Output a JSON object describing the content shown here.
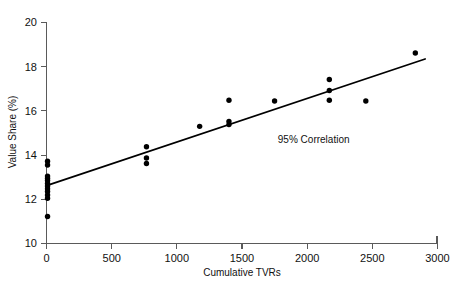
{
  "chart_data": {
    "type": "scatter",
    "title": "",
    "xlabel": "Cumulative TVRs",
    "ylabel": "Value Share (%)",
    "xlim": [
      0,
      3000
    ],
    "ylim": [
      10,
      20
    ],
    "xticks": [
      0,
      500,
      1000,
      1500,
      2000,
      2500,
      3000
    ],
    "yticks": [
      10,
      12,
      14,
      16,
      18,
      20
    ],
    "xtick_labels": [
      "0",
      "500",
      "1000",
      "1500",
      "2000",
      "2500",
      "3000"
    ],
    "ytick_labels": [
      "10",
      "12",
      "14",
      "16",
      "18",
      "20"
    ],
    "grid": false,
    "legend": null,
    "annotations": [
      {
        "text": "95% Correlation",
        "x": 2050,
        "y": 14.55
      }
    ],
    "series": [
      {
        "name": "Observations",
        "marker": "filled-circle",
        "color": "#000000",
        "points": [
          {
            "x": 8,
            "y": 13.72
          },
          {
            "x": 8,
            "y": 13.55
          },
          {
            "x": 8,
            "y": 13.05
          },
          {
            "x": 8,
            "y": 12.95
          },
          {
            "x": 8,
            "y": 12.85
          },
          {
            "x": 8,
            "y": 12.72
          },
          {
            "x": 8,
            "y": 12.6
          },
          {
            "x": 8,
            "y": 12.48
          },
          {
            "x": 8,
            "y": 12.35
          },
          {
            "x": 8,
            "y": 12.2
          },
          {
            "x": 8,
            "y": 12.05
          },
          {
            "x": 8,
            "y": 11.22
          },
          {
            "x": 767,
            "y": 14.38
          },
          {
            "x": 767,
            "y": 13.87
          },
          {
            "x": 767,
            "y": 13.62
          },
          {
            "x": 1175,
            "y": 15.3
          },
          {
            "x": 1400,
            "y": 16.48
          },
          {
            "x": 1400,
            "y": 15.52
          },
          {
            "x": 1400,
            "y": 15.38
          },
          {
            "x": 1750,
            "y": 16.45
          },
          {
            "x": 2170,
            "y": 17.42
          },
          {
            "x": 2170,
            "y": 16.92
          },
          {
            "x": 2170,
            "y": 16.48
          },
          {
            "x": 2450,
            "y": 16.45
          },
          {
            "x": 2830,
            "y": 18.62
          }
        ]
      }
    ],
    "fit_line": {
      "name": "Linear regression",
      "color": "#000000",
      "x_start": 0,
      "y_start": 12.62,
      "x_end": 2905,
      "y_end": 18.35
    }
  }
}
